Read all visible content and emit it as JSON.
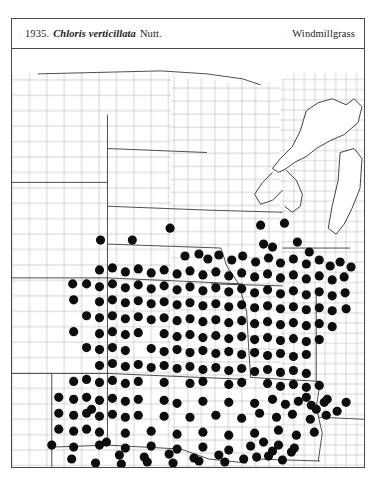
{
  "header": {
    "number": "1935.",
    "species": "Chloris verticillata",
    "authority": "Nutt.",
    "common_name": "Windmillgrass"
  },
  "map": {
    "kind": "county-level species distribution map",
    "region": "Central United States / Great Plains",
    "symbol": "filled-circle",
    "symbol_meaning": "county record of occurrence",
    "dot_color": "#0d0d0d",
    "county_line_color": "#9a9a9a",
    "state_line_color": "#2e2e2e",
    "background_color": "#ffffff",
    "frame_color": "#4a4a4a",
    "dot_radius_px": 4.6,
    "dot_count": 291
  },
  "chart_data": {
    "type": "scatter",
    "xlabel": "",
    "ylabel": "",
    "xlim": [
      0,
      354
    ],
    "ylim": [
      0,
      420
    ],
    "grid": false,
    "legend": "none",
    "series": [
      {
        "name": "county occurrence records",
        "marker": "filled-circle",
        "color": "#0d0d0d",
        "points": [
          [
            89,
            192
          ],
          [
            121,
            192
          ],
          [
            159,
            180
          ],
          [
            250,
            177
          ],
          [
            274,
            175
          ],
          [
            287,
            194
          ],
          [
            253,
            196
          ],
          [
            262,
            199
          ],
          [
            299,
            204
          ],
          [
            61,
            236
          ],
          [
            174,
            208
          ],
          [
            188,
            206
          ],
          [
            197,
            211
          ],
          [
            208,
            207
          ],
          [
            221,
            212
          ],
          [
            232,
            208
          ],
          [
            245,
            214
          ],
          [
            258,
            210
          ],
          [
            270,
            215
          ],
          [
            283,
            211
          ],
          [
            296,
            216
          ],
          [
            309,
            212
          ],
          [
            320,
            218
          ],
          [
            330,
            214
          ],
          [
            341,
            219
          ],
          [
            88,
            222
          ],
          [
            101,
            220
          ],
          [
            114,
            224
          ],
          [
            127,
            221
          ],
          [
            140,
            225
          ],
          [
            153,
            222
          ],
          [
            166,
            226
          ],
          [
            179,
            223
          ],
          [
            192,
            227
          ],
          [
            205,
            224
          ],
          [
            218,
            228
          ],
          [
            231,
            225
          ],
          [
            244,
            229
          ],
          [
            257,
            226
          ],
          [
            270,
            230
          ],
          [
            283,
            227
          ],
          [
            296,
            231
          ],
          [
            309,
            228
          ],
          [
            322,
            232
          ],
          [
            334,
            229
          ],
          [
            75,
            236
          ],
          [
            88,
            239
          ],
          [
            101,
            236
          ],
          [
            114,
            240
          ],
          [
            127,
            237
          ],
          [
            140,
            241
          ],
          [
            153,
            238
          ],
          [
            166,
            242
          ],
          [
            179,
            239
          ],
          [
            192,
            243
          ],
          [
            205,
            240
          ],
          [
            218,
            244
          ],
          [
            231,
            241
          ],
          [
            244,
            245
          ],
          [
            257,
            242
          ],
          [
            270,
            246
          ],
          [
            283,
            243
          ],
          [
            296,
            247
          ],
          [
            309,
            244
          ],
          [
            322,
            248
          ],
          [
            335,
            245
          ],
          [
            62,
            252
          ],
          [
            88,
            254
          ],
          [
            101,
            252
          ],
          [
            114,
            255
          ],
          [
            127,
            253
          ],
          [
            140,
            256
          ],
          [
            153,
            254
          ],
          [
            166,
            257
          ],
          [
            179,
            255
          ],
          [
            192,
            258
          ],
          [
            205,
            256
          ],
          [
            218,
            259
          ],
          [
            231,
            257
          ],
          [
            244,
            260
          ],
          [
            257,
            258
          ],
          [
            270,
            261
          ],
          [
            283,
            259
          ],
          [
            296,
            262
          ],
          [
            309,
            260
          ],
          [
            322,
            263
          ],
          [
            336,
            261
          ],
          [
            75,
            268
          ],
          [
            88,
            270
          ],
          [
            101,
            268
          ],
          [
            114,
            271
          ],
          [
            127,
            269
          ],
          [
            140,
            272
          ],
          [
            153,
            270
          ],
          [
            166,
            273
          ],
          [
            179,
            271
          ],
          [
            192,
            274
          ],
          [
            205,
            272
          ],
          [
            218,
            275
          ],
          [
            231,
            273
          ],
          [
            244,
            276
          ],
          [
            257,
            274
          ],
          [
            270,
            277
          ],
          [
            283,
            275
          ],
          [
            296,
            278
          ],
          [
            309,
            276
          ],
          [
            322,
            279
          ],
          [
            62,
            284
          ],
          [
            88,
            286
          ],
          [
            101,
            284
          ],
          [
            114,
            287
          ],
          [
            127,
            285
          ],
          [
            153,
            286
          ],
          [
            166,
            289
          ],
          [
            179,
            287
          ],
          [
            192,
            290
          ],
          [
            205,
            288
          ],
          [
            218,
            291
          ],
          [
            231,
            289
          ],
          [
            244,
            292
          ],
          [
            257,
            290
          ],
          [
            270,
            293
          ],
          [
            283,
            291
          ],
          [
            296,
            294
          ],
          [
            309,
            292
          ],
          [
            75,
            300
          ],
          [
            88,
            302
          ],
          [
            101,
            300
          ],
          [
            114,
            303
          ],
          [
            140,
            301
          ],
          [
            153,
            304
          ],
          [
            166,
            302
          ],
          [
            179,
            305
          ],
          [
            192,
            303
          ],
          [
            205,
            306
          ],
          [
            218,
            304
          ],
          [
            231,
            307
          ],
          [
            244,
            305
          ],
          [
            257,
            308
          ],
          [
            270,
            306
          ],
          [
            283,
            309
          ],
          [
            296,
            307
          ],
          [
            88,
            318
          ],
          [
            101,
            316
          ],
          [
            114,
            319
          ],
          [
            127,
            317
          ],
          [
            140,
            320
          ],
          [
            153,
            318
          ],
          [
            166,
            321
          ],
          [
            179,
            319
          ],
          [
            192,
            322
          ],
          [
            205,
            320
          ],
          [
            218,
            323
          ],
          [
            231,
            321
          ],
          [
            244,
            324
          ],
          [
            257,
            322
          ],
          [
            270,
            325
          ],
          [
            283,
            323
          ],
          [
            296,
            326
          ],
          [
            62,
            334
          ],
          [
            75,
            332
          ],
          [
            88,
            335
          ],
          [
            101,
            333
          ],
          [
            114,
            336
          ],
          [
            127,
            334
          ],
          [
            153,
            335
          ],
          [
            179,
            336
          ],
          [
            192,
            334
          ],
          [
            218,
            337
          ],
          [
            231,
            335
          ],
          [
            257,
            336
          ],
          [
            270,
            339
          ],
          [
            283,
            337
          ],
          [
            296,
            340
          ],
          [
            309,
            338
          ],
          [
            47,
            350
          ],
          [
            62,
            352
          ],
          [
            75,
            350
          ],
          [
            88,
            353
          ],
          [
            101,
            351
          ],
          [
            114,
            354
          ],
          [
            127,
            352
          ],
          [
            153,
            353
          ],
          [
            166,
            356
          ],
          [
            192,
            354
          ],
          [
            218,
            355
          ],
          [
            244,
            356
          ],
          [
            262,
            352
          ],
          [
            275,
            357
          ],
          [
            288,
            354
          ],
          [
            301,
            358
          ],
          [
            314,
            355
          ],
          [
            47,
            366
          ],
          [
            62,
            368
          ],
          [
            75,
            366
          ],
          [
            88,
            369
          ],
          [
            101,
            367
          ],
          [
            114,
            370
          ],
          [
            127,
            368
          ],
          [
            153,
            369
          ],
          [
            179,
            370
          ],
          [
            205,
            368
          ],
          [
            231,
            371
          ],
          [
            249,
            366
          ],
          [
            266,
            370
          ],
          [
            282,
            367
          ],
          [
            300,
            372
          ],
          [
            316,
            368
          ],
          [
            47,
            382
          ],
          [
            62,
            384
          ],
          [
            75,
            382
          ],
          [
            88,
            385
          ],
          [
            114,
            386
          ],
          [
            140,
            384
          ],
          [
            166,
            387
          ],
          [
            192,
            385
          ],
          [
            218,
            388
          ],
          [
            244,
            386
          ],
          [
            268,
            383
          ],
          [
            286,
            388
          ],
          [
            304,
            385
          ],
          [
            40,
            398
          ],
          [
            62,
            400
          ],
          [
            88,
            398
          ],
          [
            114,
            401
          ],
          [
            140,
            399
          ],
          [
            166,
            402
          ],
          [
            192,
            400
          ],
          [
            218,
            403
          ],
          [
            240,
            399
          ],
          [
            262,
            404
          ],
          [
            284,
            401
          ],
          [
            80,
            362
          ],
          [
            95,
            395
          ],
          [
            108,
            408
          ],
          [
            133,
            410
          ],
          [
            158,
            407
          ],
          [
            183,
            411
          ],
          [
            208,
            408
          ],
          [
            233,
            412
          ],
          [
            258,
            409
          ],
          [
            281,
            405
          ],
          [
            296,
            350
          ],
          [
            306,
            362
          ],
          [
            317,
            352
          ],
          [
            327,
            364
          ],
          [
            336,
            355
          ],
          [
            253,
            395
          ],
          [
            268,
            398
          ],
          [
            246,
            410
          ],
          [
            272,
            413
          ],
          [
            214,
            415
          ],
          [
            188,
            414
          ],
          [
            162,
            416
          ],
          [
            136,
            415
          ],
          [
            110,
            417
          ],
          [
            84,
            416
          ],
          [
            60,
            412
          ]
        ]
      }
    ]
  }
}
